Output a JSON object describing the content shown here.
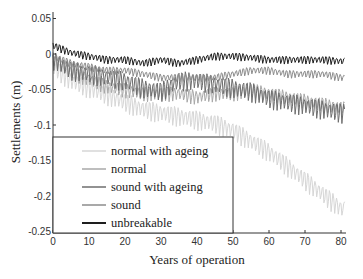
{
  "chart_data": {
    "type": "line",
    "title": "",
    "xlabel": "Years of operation",
    "ylabel": "Settlements (m)",
    "xlim": [
      0,
      82
    ],
    "ylim": [
      -0.25,
      0.06
    ],
    "xticks": [
      0,
      10,
      20,
      30,
      40,
      50,
      60,
      70,
      80
    ],
    "xtick_labels": [
      "0",
      "10",
      "20",
      "30",
      "40",
      "50",
      "60",
      "70",
      "80"
    ],
    "yticks": [
      0.05,
      0,
      -0.05,
      -0.1,
      -0.15,
      -0.2,
      -0.25
    ],
    "ytick_labels": [
      "0.05",
      "0",
      "-0.05",
      "-0.1",
      "-0.15",
      "-0.2",
      "-0.25"
    ],
    "grid": false,
    "legend_position": "lower left (inside plot)",
    "oscillation_period_years": 1,
    "x": [
      0,
      5,
      10,
      15,
      20,
      25,
      30,
      35,
      40,
      45,
      50,
      55,
      60,
      65,
      70,
      75,
      80
    ],
    "series": [
      {
        "name": "normal with ageing",
        "color": "#d6d6d6",
        "values": [
          -0.01,
          -0.03,
          -0.04,
          -0.05,
          -0.06,
          -0.07,
          -0.075,
          -0.08,
          -0.085,
          -0.09,
          -0.1,
          -0.115,
          -0.13,
          -0.15,
          -0.17,
          -0.19,
          -0.21
        ],
        "amplitude": 0.02
      },
      {
        "name": "normal",
        "color": "#a8a8a8",
        "values": [
          0.0,
          -0.02,
          -0.03,
          -0.04,
          -0.045,
          -0.05,
          -0.05,
          -0.05,
          -0.055,
          -0.05,
          -0.05,
          -0.045,
          -0.05,
          -0.055,
          -0.06,
          -0.065,
          -0.07
        ],
        "amplitude": 0.015
      },
      {
        "name": "sound with ageing",
        "color": "#6e6e6e",
        "values": [
          0.0,
          -0.015,
          -0.02,
          -0.025,
          -0.03,
          -0.04,
          -0.045,
          -0.03,
          -0.03,
          -0.035,
          -0.04,
          -0.045,
          -0.055,
          -0.06,
          -0.065,
          -0.07,
          -0.075
        ],
        "amplitude": 0.02
      },
      {
        "name": "sound",
        "color": "#8c8c8c",
        "values": [
          0.0,
          -0.01,
          -0.015,
          -0.02,
          -0.02,
          -0.025,
          -0.03,
          -0.03,
          -0.03,
          -0.03,
          -0.025,
          -0.02,
          -0.02,
          -0.025,
          -0.025,
          -0.025,
          -0.03
        ],
        "amplitude": 0.008
      },
      {
        "name": "unbreakable",
        "color": "#1e1e1e",
        "values": [
          0.015,
          0.005,
          0.0,
          -0.005,
          -0.005,
          -0.01,
          -0.005,
          -0.01,
          -0.005,
          0.0,
          0.0,
          -0.002,
          -0.005,
          -0.005,
          -0.005,
          -0.005,
          -0.007
        ],
        "amplitude": 0.008
      }
    ]
  },
  "legend": {
    "items": [
      {
        "label": "normal with ageing",
        "color": "#d6d6d6"
      },
      {
        "label": "normal",
        "color": "#a8a8a8"
      },
      {
        "label": "sound with ageing",
        "color": "#6e6e6e"
      },
      {
        "label": "sound",
        "color": "#8c8c8c"
      },
      {
        "label": "unbreakable",
        "color": "#1e1e1e"
      }
    ]
  }
}
